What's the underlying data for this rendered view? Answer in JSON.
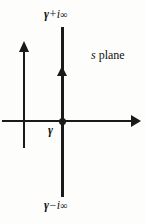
{
  "figure": {
    "name": "bromwich-contour-s-plane",
    "background_color": "#fdfdfc",
    "ink_color": "#1a1a1a"
  },
  "labels": {
    "top": {
      "gamma": "γ",
      "operator": "+",
      "imaginary_unit": "i",
      "infinity": "∞",
      "full_text": "γ + i∞"
    },
    "bottom": {
      "gamma": "γ",
      "operator": "−",
      "imaginary_unit": "i",
      "infinity": "∞",
      "full_text": "γ − i∞"
    },
    "abscissa": {
      "gamma": "γ"
    },
    "plane": {
      "variable": "s",
      "word": "plane",
      "full_text": "s plane"
    }
  },
  "axes": {
    "real_axis_name": "real-axis",
    "imaginary_axis_name": "imaginary-axis",
    "contour_name": "bromwich-contour"
  }
}
